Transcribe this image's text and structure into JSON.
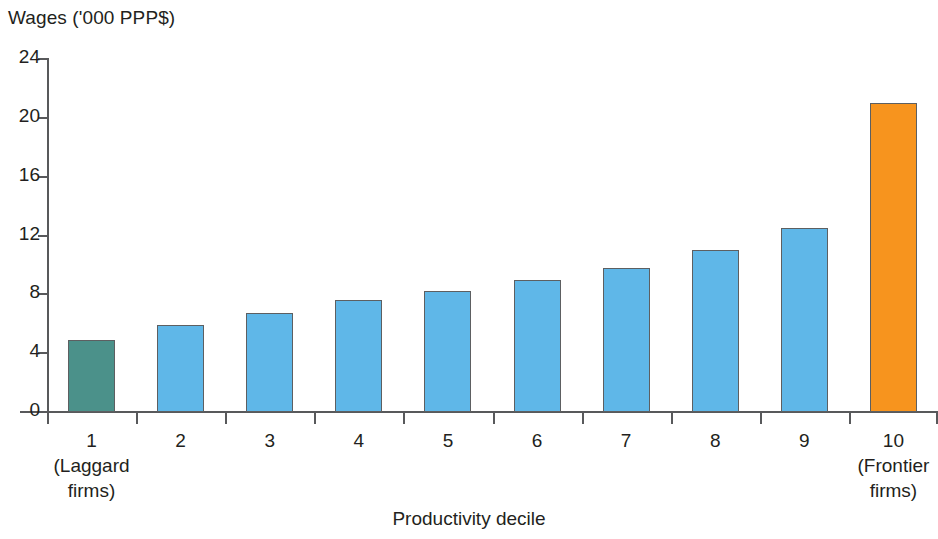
{
  "chart_data": {
    "type": "bar",
    "title": "",
    "ylabel": "Wages ('000 PPP$)",
    "xlabel": "Productivity decile",
    "categories": [
      "1",
      "2",
      "3",
      "4",
      "5",
      "6",
      "7",
      "8",
      "9",
      "10"
    ],
    "category_sublabels": [
      "(Laggard\nfirms)",
      "",
      "",
      "",
      "",
      "",
      "",
      "",
      "",
      "(Frontier\nfirms)"
    ],
    "values": [
      4.9,
      5.9,
      6.7,
      7.6,
      8.2,
      9.0,
      9.8,
      11.0,
      12.5,
      21.0
    ],
    "ylim": [
      0,
      24
    ],
    "ytick_labels": [
      "24",
      "20",
      "16",
      "12",
      "8",
      "4",
      "0"
    ],
    "yticks": [
      24,
      20,
      16,
      12,
      8,
      4,
      0
    ],
    "grid": false,
    "legend": "none",
    "bar_colors": [
      "#4b918a",
      "#5fb7e8",
      "#5fb7e8",
      "#5fb7e8",
      "#5fb7e8",
      "#5fb7e8",
      "#5fb7e8",
      "#5fb7e8",
      "#5fb7e8",
      "#f7941e"
    ],
    "bar_border_color": "#5d5f61",
    "colors": {
      "laggard": "#4b918a",
      "middle": "#5fb7e8",
      "frontier": "#f7941e",
      "axis": "#58595b",
      "text": "#231f20",
      "background": "#ffffff"
    }
  },
  "labels": {
    "y_axis_title": "Wages ('000 PPP$)",
    "x_axis_title": "Productivity decile",
    "decile_1_line1": "1",
    "decile_1_line2": "(Laggard",
    "decile_1_line3": "firms)",
    "decile_10_line1": "10",
    "decile_10_line2": "(Frontier",
    "decile_10_line3": "firms)",
    "decile_2": "2",
    "decile_3": "3",
    "decile_4": "4",
    "decile_5": "5",
    "decile_6": "6",
    "decile_7": "7",
    "decile_8": "8",
    "decile_9": "9",
    "ytick_24": "24",
    "ytick_20": "20",
    "ytick_16": "16",
    "ytick_12": "12",
    "ytick_8": "8",
    "ytick_4": "4",
    "ytick_0": "0"
  }
}
